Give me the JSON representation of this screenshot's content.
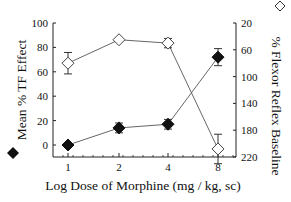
{
  "chart_data": {
    "type": "line",
    "title": "",
    "xlabel": "Log Dose of Morphine (mg / kg, sc)",
    "ylabel": "Mean % TF Effect",
    "y2label": "% Flexor Reflex Baseline",
    "categories": [
      "1",
      "2",
      "4",
      "8"
    ],
    "x": [
      1,
      2,
      4,
      8
    ],
    "ylim": [
      -8,
      100
    ],
    "y_ticks": [
      0,
      20,
      40,
      60,
      80,
      100
    ],
    "y2lim": [
      20,
      220
    ],
    "y2_ticks": [
      20,
      60,
      100,
      140,
      180,
      220
    ],
    "y2_inverted": true,
    "grid": false,
    "legend": {
      "position": "beside axis titles",
      "entries": [
        {
          "marker": "filled-diamond",
          "label": "Mean % TF Effect",
          "axis": "left"
        },
        {
          "marker": "open-diamond",
          "label": "% Flexor Reflex Baseline",
          "axis": "right"
        }
      ]
    },
    "series": [
      {
        "name": "Mean % TF Effect",
        "marker": "filled-diamond",
        "axis": "left",
        "values": [
          0,
          14,
          17,
          72
        ],
        "error": [
          0,
          4,
          4,
          7
        ]
      },
      {
        "name": "% Flexor Reflex Baseline",
        "marker": "open-diamond",
        "axis": "right",
        "values": [
          80,
          45,
          50,
          208
        ],
        "error": [
          16,
          0,
          7,
          22
        ]
      }
    ]
  }
}
